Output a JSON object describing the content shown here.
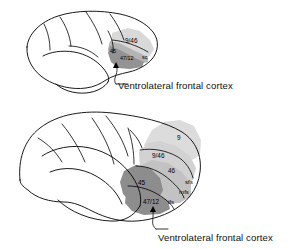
{
  "figure": {
    "background_color": "#ffffff",
    "line_color": "#000000",
    "width": 295,
    "height": 249
  },
  "colors": {
    "region_light_gray": "#d9d9d9",
    "region_mid_gray": "#b5b5b5",
    "region_dark_gray": "#8f8f8f",
    "outline": "#000000",
    "text": "#111111"
  },
  "panels": [
    {
      "id": "top-panel",
      "name": "macaque-lateral-view",
      "caption": "Ventrolateral frontal cortex",
      "area_labels": [
        {
          "key": "a946",
          "text": "9/46"
        },
        {
          "key": "a45",
          "text": "45"
        },
        {
          "key": "a4712",
          "text": "47/12"
        },
        {
          "key": "asc",
          "text": "sc"
        }
      ]
    },
    {
      "id": "bottom-panel",
      "name": "human-lateral-view",
      "caption": "Ventrolateral frontal cortex",
      "area_labels": [
        {
          "key": "b9",
          "text": "9"
        },
        {
          "key": "b946",
          "text": "9/46"
        },
        {
          "key": "b46",
          "text": "46"
        },
        {
          "key": "b45",
          "text": "45"
        },
        {
          "key": "b4712",
          "text": "47/12"
        }
      ],
      "sulcus_labels": [
        {
          "key": "sfs",
          "text": "sfs"
        },
        {
          "key": "mfs",
          "text": "mfs"
        },
        {
          "key": "ifs",
          "text": "ifs"
        }
      ]
    }
  ]
}
